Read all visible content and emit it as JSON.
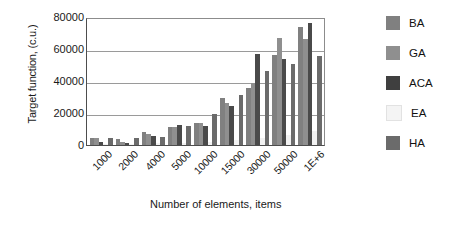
{
  "chart_data": {
    "type": "bar",
    "title": "",
    "xlabel": "Number of elements, items",
    "ylabel": "Target function, (c.u.)",
    "categories": [
      "1000",
      "2000",
      "4000",
      "5000",
      "10000",
      "15000",
      "30000",
      "50000",
      "1E+6"
    ],
    "ylim": [
      0,
      80000
    ],
    "yticks": [
      0,
      20000,
      40000,
      60000,
      80000
    ],
    "ytick_labels": [
      "0",
      "20000",
      "40000",
      "60000",
      "80000"
    ],
    "grid": true,
    "legend_position": "right",
    "series": [
      {
        "name": "BA",
        "color": "#808080",
        "values": [
          4200,
          4000,
          8000,
          11500,
          14000,
          29500,
          35500,
          56500,
          74000
        ]
      },
      {
        "name": "GA",
        "color": "#8f8f8f",
        "values": [
          4300,
          2000,
          7000,
          11000,
          13500,
          26000,
          38500,
          67000,
          66000
        ]
      },
      {
        "name": "ACA",
        "color": "#4a4a4a",
        "values": [
          1800,
          1200,
          5500,
          12500,
          12000,
          24500,
          57000,
          53500,
          76000
        ]
      },
      {
        "name": "EA",
        "color": "#f2f2f2",
        "values": [
          500,
          600,
          1000,
          1500,
          2000,
          3000,
          4500,
          6000,
          9000
        ]
      },
      {
        "name": "HA",
        "color": "#6b6b6b",
        "values": [
          4100,
          4500,
          5000,
          12000,
          19500,
          31000,
          46000,
          50500,
          55500
        ]
      }
    ]
  },
  "legend": {
    "items": [
      {
        "label": "BA",
        "color": "#808080"
      },
      {
        "label": "GA",
        "color": "#8f8f8f"
      },
      {
        "label": "ACA",
        "color": "#3f3f3f"
      },
      {
        "label": "EA",
        "color": "#f4f4f4"
      },
      {
        "label": "HA",
        "color": "#6b6b6b"
      }
    ]
  }
}
